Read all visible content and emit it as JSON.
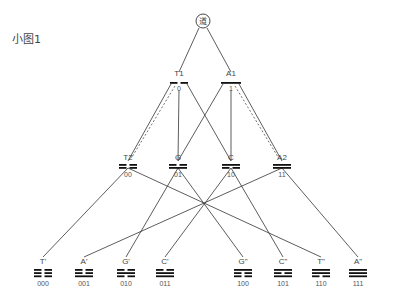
{
  "title": "小图1",
  "root": {
    "label": "道",
    "x": 203,
    "y": 21
  },
  "level1": [
    {
      "id": "T1",
      "label": "T1",
      "code": "0",
      "x": 179,
      "lines": [
        "yin"
      ]
    },
    {
      "id": "A1",
      "label": "A1",
      "code": "1",
      "x": 231,
      "lines": [
        "yang"
      ]
    }
  ],
  "level2": [
    {
      "id": "T2",
      "label": "T2",
      "code": "00",
      "x": 128,
      "lines": [
        "yin",
        "yin"
      ]
    },
    {
      "id": "G",
      "label": "G",
      "code": "01",
      "x": 178,
      "lines": [
        "yin",
        "yang"
      ]
    },
    {
      "id": "C",
      "label": "C",
      "code": "10",
      "x": 231,
      "lines": [
        "yang",
        "yin"
      ]
    },
    {
      "id": "A2",
      "label": "A2",
      "code": "11",
      "x": 282,
      "lines": [
        "yang",
        "yang"
      ]
    }
  ],
  "level3": [
    {
      "id": "T'",
      "label": "T'",
      "code": "000",
      "x": 43,
      "lines": [
        "yin",
        "yin",
        "yin"
      ]
    },
    {
      "id": "A'",
      "label": "A'",
      "code": "001",
      "x": 84,
      "lines": [
        "yin",
        "yin",
        "yang"
      ]
    },
    {
      "id": "G'",
      "label": "G'",
      "code": "010",
      "x": 126,
      "lines": [
        "yin",
        "yang",
        "yin"
      ]
    },
    {
      "id": "C'",
      "label": "C'",
      "code": "011",
      "x": 165,
      "lines": [
        "yin",
        "yang",
        "yang"
      ]
    },
    {
      "id": "G\"",
      "label": "G\"",
      "code": "100",
      "x": 243,
      "lines": [
        "yang",
        "yin",
        "yin"
      ]
    },
    {
      "id": "C\"",
      "label": "C\"",
      "code": "101",
      "x": 283,
      "lines": [
        "yang",
        "yin",
        "yang"
      ]
    },
    {
      "id": "T\"",
      "label": "T\"",
      "code": "110",
      "x": 321,
      "lines": [
        "yang",
        "yang",
        "yin"
      ]
    },
    {
      "id": "A\"",
      "label": "A\"",
      "code": "111",
      "x": 358,
      "lines": [
        "yang",
        "yang",
        "yang"
      ]
    }
  ],
  "edges": [
    {
      "from": "root",
      "to": "T1"
    },
    {
      "from": "root",
      "to": "A1"
    },
    {
      "from": "T1",
      "to": "T2",
      "dashed_companion": true
    },
    {
      "from": "T1",
      "to": "G"
    },
    {
      "from": "T1",
      "to": "C"
    },
    {
      "from": "A1",
      "to": "G"
    },
    {
      "from": "A1",
      "to": "C"
    },
    {
      "from": "A1",
      "to": "A2",
      "dashed_companion": true
    },
    {
      "from": "T2",
      "to": "T'"
    },
    {
      "from": "T2",
      "to": "T\""
    },
    {
      "from": "G",
      "to": "G'"
    },
    {
      "from": "G",
      "to": "G\""
    },
    {
      "from": "C",
      "to": "C'"
    },
    {
      "from": "C",
      "to": "C\""
    },
    {
      "from": "A2",
      "to": "A'"
    },
    {
      "from": "A2",
      "to": "A\""
    }
  ],
  "colors": {
    "line": "#333333",
    "bar": "#111111",
    "text": "#444444"
  }
}
